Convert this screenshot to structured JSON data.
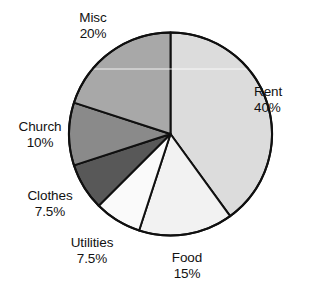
{
  "chart_data": {
    "type": "pie",
    "title": "",
    "categories": [
      "Rent",
      "Food",
      "Utilities",
      "Clothes",
      "Church",
      "Misc"
    ],
    "values": [
      40,
      15,
      7.5,
      7.5,
      10,
      20
    ],
    "value_unit": "%",
    "start_angle_deg": 0,
    "direction": "clockwise",
    "legend": "none",
    "labels_position": "outside",
    "slices": [
      {
        "name": "Rent",
        "value": 40,
        "value_label": "40%",
        "color": "#dcdcdc",
        "start_deg": 0,
        "end_deg": 144
      },
      {
        "name": "Food",
        "value": 15,
        "value_label": "15%",
        "color": "#f2f2f2",
        "start_deg": 144,
        "end_deg": 198
      },
      {
        "name": "Utilities",
        "value": 7.5,
        "value_label": "7.5%",
        "color": "#fafafa",
        "start_deg": 198,
        "end_deg": 225
      },
      {
        "name": "Clothes",
        "value": 7.5,
        "value_label": "7.5%",
        "color": "#585858",
        "start_deg": 225,
        "end_deg": 252
      },
      {
        "name": "Church",
        "value": 10,
        "value_label": "10%",
        "color": "#8a8a8a",
        "start_deg": 252,
        "end_deg": 288
      },
      {
        "name": "Misc",
        "value": 20,
        "value_label": "20%",
        "color": "#a8a8a8",
        "start_deg": 288,
        "end_deg": 360
      }
    ],
    "geometry": {
      "cx": 170.5,
      "cy": 134,
      "r": 101.5
    },
    "style": {
      "stroke": "#101010",
      "stroke_width": 2,
      "background": "#ffffff"
    }
  }
}
